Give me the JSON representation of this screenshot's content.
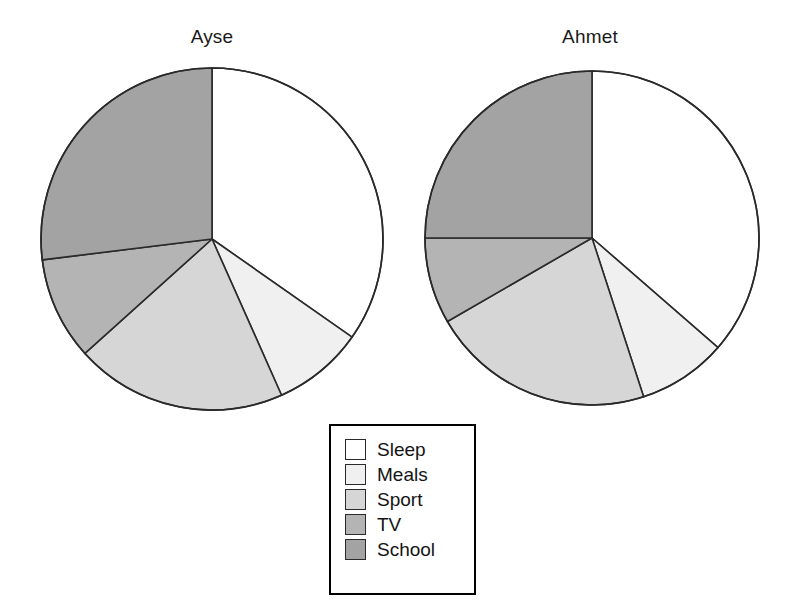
{
  "figure": {
    "background_color": "#ffffff",
    "outline_color": "#2a2a2a"
  },
  "legend": {
    "name": "legend",
    "position": "bottom-center",
    "border_color": "#000000",
    "items": [
      {
        "label": "Sleep",
        "color": "#ffffff"
      },
      {
        "label": "Meals",
        "color": "#f0f0f0"
      },
      {
        "label": "Sport",
        "color": "#d6d6d6"
      },
      {
        "label": "TV",
        "color": "#b4b4b4"
      },
      {
        "label": "School",
        "color": "#a3a3a3"
      }
    ]
  },
  "chart_data": [
    {
      "type": "pie",
      "title": "Ayse",
      "categories": [
        "Sleep",
        "Meals",
        "Sport",
        "TV",
        "School"
      ],
      "colors": [
        "#ffffff",
        "#f0f0f0",
        "#d6d6d6",
        "#b4b4b4",
        "#a3a3a3"
      ],
      "angles_deg": [
        125,
        31,
        72,
        35,
        97
      ],
      "values_percent": [
        34.7,
        8.6,
        20.0,
        9.7,
        27.0
      ],
      "start_angle_deg": 0,
      "direction": "clockwise",
      "xlabel": "",
      "ylabel": "",
      "legend": "bottom-center",
      "grid": false
    },
    {
      "type": "pie",
      "title": "Ahmet",
      "categories": [
        "Sleep",
        "Meals",
        "Sport",
        "TV",
        "School"
      ],
      "colors": [
        "#ffffff",
        "#f0f0f0",
        "#d6d6d6",
        "#b4b4b4",
        "#a3a3a3"
      ],
      "angles_deg": [
        131,
        31,
        78,
        30,
        90
      ],
      "values_percent": [
        36.4,
        8.6,
        21.7,
        8.3,
        25.0
      ],
      "start_angle_deg": 0,
      "direction": "clockwise",
      "xlabel": "",
      "ylabel": "",
      "legend": "bottom-center",
      "grid": false
    }
  ],
  "layout": {
    "panels": [
      {
        "left": 22,
        "top": 26,
        "width": 380,
        "circle_cx": 190,
        "circle_cy": 213,
        "radius": 171
      },
      {
        "left": 410,
        "top": 26,
        "width": 360,
        "circle_cx": 182,
        "circle_cy": 212,
        "radius": 167
      }
    ],
    "legend_box": {
      "left": 329,
      "top": 424,
      "width": 147,
      "height": 171
    }
  }
}
